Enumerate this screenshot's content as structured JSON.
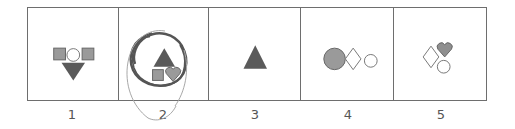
{
  "colors": {
    "frame": "#6e6e6e",
    "dark_shape": "#5a5a5a",
    "medium_shape": "#9a9a9a",
    "outline_shape": "#777777",
    "pencil_dark": "#555555",
    "pencil_light": "#a8a8a8"
  },
  "options": [
    {
      "label": "1",
      "shapes": [
        "square-filled",
        "circle-outline",
        "square-filled",
        "triangle-down-dark"
      ]
    },
    {
      "label": "2",
      "shapes": [
        "triangle-up-dark",
        "square-filled",
        "heart-filled"
      ],
      "annotated": true
    },
    {
      "label": "3",
      "shapes": [
        "triangle-up-dark"
      ]
    },
    {
      "label": "4",
      "shapes": [
        "circle-filled-large",
        "diamond-outline",
        "circle-outline"
      ]
    },
    {
      "label": "5",
      "shapes": [
        "diamond-outline",
        "heart-filled",
        "circle-outline"
      ]
    }
  ]
}
